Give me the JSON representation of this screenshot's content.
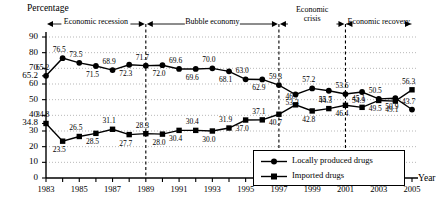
{
  "chart_data": {
    "type": "line",
    "title": "",
    "ylabel": "Percentage",
    "xlabel": "Year",
    "ylim": [
      0,
      90
    ],
    "ytick_step": 10,
    "yticks": [
      "0",
      "10",
      "20",
      "30",
      "40",
      "50",
      "60",
      "70",
      "80",
      "90"
    ],
    "extra_yticks": [
      {
        "value": "65.2",
        "y": 65.2
      },
      {
        "value": "34.8",
        "y": 34.8
      }
    ],
    "grid": true,
    "legend_position": "bottom-right",
    "x": [
      1983,
      1984,
      1985,
      1986,
      1987,
      1988,
      1989,
      1990,
      1991,
      1992,
      1993,
      1994,
      1995,
      1996,
      1997,
      1998,
      1999,
      2000,
      2001,
      2002,
      2003,
      2004,
      2005
    ],
    "xtick_labels": [
      "1983",
      "1985",
      "1987",
      "1989",
      "1991",
      "1993",
      "1995",
      "1997",
      "1999",
      "2001",
      "2003",
      "2005"
    ],
    "series": [
      {
        "name": "Locally produced drugs",
        "marker": "circle",
        "values": [
          65.2,
          76.5,
          73.5,
          71.5,
          68.9,
          72.3,
          71.7,
          72.0,
          69.6,
          69.6,
          70.0,
          68.1,
          63.0,
          62.9,
          59.3,
          53.3,
          57.2,
          55.7,
          53.6,
          54.9,
          50.5,
          50.9,
          43.7
        ],
        "labels": [
          "65.2",
          "76.5",
          "73.5",
          "71.5",
          "68.9",
          "72.3",
          "71.7",
          "72.0",
          "69.6",
          "69.6",
          "70.0",
          "68.1",
          "63.0",
          "62.9",
          "59.3",
          "53.3",
          "57.2",
          "55.7",
          "53.6",
          "54.9",
          "50.5",
          "50.9",
          "43.7"
        ]
      },
      {
        "name": "Imported drugs",
        "marker": "square",
        "values": [
          34.8,
          23.5,
          26.5,
          28.5,
          31.1,
          27.7,
          28.3,
          28.0,
          30.4,
          30.4,
          30.0,
          31.9,
          37.0,
          37.1,
          40.7,
          46.7,
          42.8,
          44.3,
          46.4,
          45.1,
          49.5,
          49.1,
          56.3
        ],
        "labels": [
          "34.8",
          "23.5",
          "26.5",
          "28.5",
          "31.1",
          "27.7",
          "28.3",
          "28.0",
          "30.4",
          "30.4",
          "30.0",
          "31.9",
          "37.0",
          "37.1",
          "40.7",
          "46.7",
          "42.8",
          "44.3",
          "46.4",
          "45.1",
          "49.5",
          "49.1",
          "56.3"
        ]
      }
    ],
    "annotations": [
      {
        "name": "economic-recession",
        "label": "Economic recession",
        "from": 1983,
        "to": 1989,
        "arrows": "both"
      },
      {
        "name": "bubble-economy",
        "label": "Bubble economy",
        "from": 1989,
        "to": 1997,
        "arrows": "both"
      },
      {
        "name": "economic-crisis",
        "label": "Economic\ncrisis",
        "line1": "Economic",
        "line2": "crisis",
        "from": 1997,
        "to": 2001,
        "arrows": "both"
      },
      {
        "name": "economic-recovery",
        "label": "Economic recovery",
        "from": 2001,
        "to": 2005,
        "arrows": "both"
      }
    ],
    "dividers": [
      1989,
      1997,
      2001
    ]
  },
  "legend": {
    "items": [
      {
        "label": "Locally produced drugs",
        "marker": "circle"
      },
      {
        "label": "Imported drugs",
        "marker": "square"
      }
    ]
  }
}
